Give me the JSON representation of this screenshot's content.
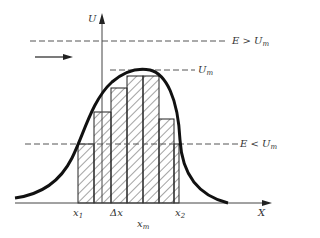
{
  "diagram": {
    "type": "potential-barrier-tunneling",
    "colors": {
      "ink": "#1a1a1a",
      "hatch": "#333333",
      "dash": "#555555",
      "background": "#ffffff"
    },
    "axes": {
      "y_label": "U",
      "x_label": "X"
    },
    "levels": {
      "high_energy": {
        "label_main": "E > U",
        "label_sub": "m"
      },
      "peak": {
        "label_main": "U",
        "label_sub": "m"
      },
      "low_energy": {
        "label_main": "E < U",
        "label_sub": "m"
      }
    },
    "x_markers": {
      "x1": {
        "label_main": "x",
        "label_sub": "1"
      },
      "dx": {
        "label": "Δx"
      },
      "xm": {
        "label_main": "x",
        "label_sub": "m"
      },
      "x2": {
        "label_main": "x",
        "label_sub": "2"
      }
    },
    "incident_arrow": {
      "direction": "right"
    },
    "bars": [
      {
        "x0": 78,
        "x1": 94,
        "top": 144
      },
      {
        "x0": 94,
        "x1": 111,
        "top": 112
      },
      {
        "x0": 111,
        "x1": 127,
        "top": 88
      },
      {
        "x0": 127,
        "x1": 143,
        "top": 76
      },
      {
        "x0": 143,
        "x1": 159,
        "top": 76
      },
      {
        "x0": 159,
        "x1": 174,
        "top": 119
      },
      {
        "x0": 174,
        "x1": 179,
        "top": 144
      }
    ]
  }
}
